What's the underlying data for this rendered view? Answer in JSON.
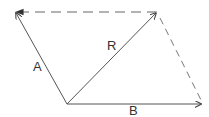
{
  "diagram": {
    "type": "vector-parallelogram",
    "colors": {
      "solid": "#555555",
      "dashed": "#777777",
      "text": "#333333"
    },
    "origin": [
      67,
      104
    ],
    "vectors": [
      {
        "name": "A",
        "label": "A",
        "from": [
          67,
          104
        ],
        "to": [
          15,
          12
        ],
        "label_pos": [
          38,
          68
        ]
      },
      {
        "name": "R",
        "label": "R",
        "from": [
          67,
          104
        ],
        "to": [
          157,
          12
        ],
        "label_pos": [
          112,
          50
        ]
      },
      {
        "name": "B",
        "label": "B",
        "from": [
          67,
          104
        ],
        "to": [
          202,
          104
        ],
        "label_pos": [
          134,
          114
        ]
      }
    ],
    "dashed_lines": [
      {
        "name": "top-side",
        "from": [
          157,
          12
        ],
        "to": [
          15,
          12
        ]
      },
      {
        "name": "right-side",
        "from": [
          157,
          12
        ],
        "to": [
          202,
          104
        ]
      }
    ]
  }
}
